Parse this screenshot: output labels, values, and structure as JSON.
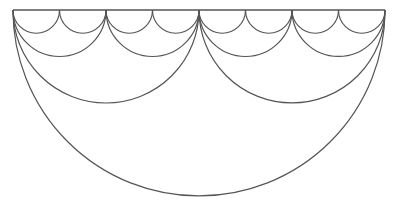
{
  "diagram": {
    "type": "nested-semicircles",
    "background": "#ffffff",
    "stroke_color": "#555555",
    "baseline": {
      "x1": 13,
      "x2": 385,
      "y": 10
    },
    "levels": [
      {
        "name": "level-1",
        "count": 1
      },
      {
        "name": "level-2",
        "count": 2
      },
      {
        "name": "level-3",
        "count": 4
      },
      {
        "name": "level-4",
        "count": 8
      }
    ]
  }
}
